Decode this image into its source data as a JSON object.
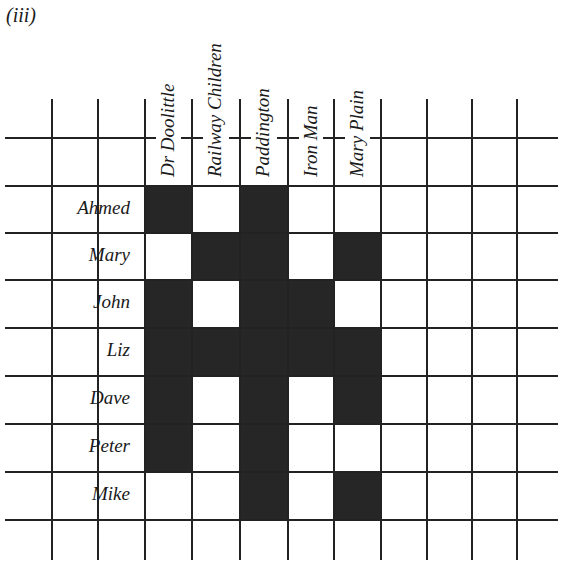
{
  "figure": {
    "label": "(iii)"
  },
  "columns": [
    "Dr  Doolittle",
    "Railway  Children",
    "Paddington",
    "Iron Man",
    "Mary  Plain"
  ],
  "rows": [
    {
      "name": "Ahmed",
      "cells": [
        1,
        0,
        1,
        0,
        0
      ]
    },
    {
      "name": "Mary",
      "cells": [
        0,
        1,
        1,
        0,
        1
      ]
    },
    {
      "name": "John",
      "cells": [
        1,
        0,
        1,
        1,
        0
      ]
    },
    {
      "name": "Liz",
      "cells": [
        1,
        1,
        1,
        1,
        1
      ]
    },
    {
      "name": "Dave",
      "cells": [
        1,
        0,
        1,
        0,
        1
      ]
    },
    {
      "name": "Peter",
      "cells": [
        1,
        0,
        1,
        0,
        0
      ]
    },
    {
      "name": "Mike",
      "cells": [
        0,
        0,
        1,
        0,
        1
      ]
    }
  ],
  "colors": {
    "filled": "#262626",
    "line": "#222222",
    "background": "#ffffff"
  }
}
